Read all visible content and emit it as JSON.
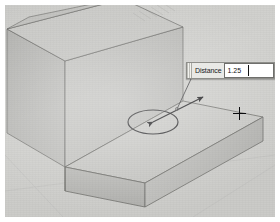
{
  "app": {
    "view_name": "3d-modeling-viewport",
    "projection": "isometric"
  },
  "callout": {
    "name": "distance-input-callout",
    "label": "Distance",
    "value": "1.25",
    "placeholder": "",
    "spare_value": ""
  },
  "cursor": {
    "type": "crosshair",
    "x": 234,
    "y": 108
  },
  "manipulator": {
    "handle_type": "drag-handle-ellipse",
    "arrow_type": "double-ended-dimension-arrow",
    "leader_type": "callout-leader-line"
  },
  "colors": {
    "background": "#d3d3d1",
    "face_top_light": "#cfcfcc",
    "face_top_plate": "#c9c9c6",
    "face_front_dark": "#b3b3b0",
    "face_side_mid": "#bfbfbc",
    "face_wall_light": "#c6c6c3",
    "face_wall_shadow": "#b9b9b6",
    "edge_line": "#6d6d6a",
    "annotation": "#2a2a2c",
    "callout_bg": "#e9e9e6",
    "callout_field": "#ffffff",
    "cursor": "#0c0c0e"
  },
  "geometry": {
    "solid": "stepped-l-block",
    "features": [
      "base-plate",
      "vertical-wall",
      "upper-step"
    ]
  }
}
